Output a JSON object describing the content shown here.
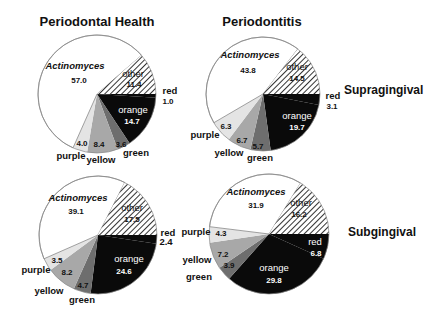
{
  "colors": {
    "actinomyces": "#ffffff",
    "other_hatch_bg": "#ffffff",
    "other_hatch_line": "#333333",
    "red": "#0a0a0a",
    "orange": "#0a0a0a",
    "green": "#6e6e6e",
    "yellow": "#a8a8a8",
    "purple": "#e4e4e4",
    "outline": "#888888",
    "text_dark": "#111111",
    "text_light": "#ffffff"
  },
  "column_titles": [
    "Periodontal Health",
    "Periodontitis"
  ],
  "row_labels": [
    "Supragingival",
    "Subgingival"
  ],
  "chart_data": [
    {
      "type": "pie",
      "title": "Periodontal Health",
      "row": "Supragingival",
      "categories": [
        "red",
        "orange",
        "green",
        "yellow",
        "purple",
        "Actinomyces",
        "other"
      ],
      "values": [
        1.0,
        14.7,
        3.6,
        8.4,
        4.0,
        57.0,
        11.4
      ],
      "start_angle_deg": 0,
      "direction": "clockwise"
    },
    {
      "type": "pie",
      "title": "Periodontitis",
      "row": "Supragingival",
      "categories": [
        "red",
        "orange",
        "green",
        "yellow",
        "purple",
        "Actinomyces",
        "other"
      ],
      "values": [
        3.1,
        19.7,
        5.7,
        6.7,
        6.3,
        43.8,
        14.5
      ],
      "start_angle_deg": 0,
      "direction": "clockwise"
    },
    {
      "type": "pie",
      "title": "Periodontal Health",
      "row": "Subgingival",
      "categories": [
        "red",
        "orange",
        "green",
        "yellow",
        "purple",
        "Actinomyces",
        "other"
      ],
      "values": [
        2.4,
        24.6,
        4.7,
        8.2,
        3.5,
        39.1,
        17.5
      ],
      "start_angle_deg": 0,
      "direction": "clockwise"
    },
    {
      "type": "pie",
      "title": "Periodontitis",
      "row": "Subgingival",
      "categories": [
        "red",
        "orange",
        "green",
        "yellow",
        "purple",
        "Actinomyces",
        "other"
      ],
      "values": [
        6.8,
        29.8,
        3.9,
        7.2,
        4.3,
        31.9,
        16.2
      ],
      "start_angle_deg": 0,
      "direction": "clockwise"
    }
  ],
  "pies": [
    {
      "cx": 97,
      "cy": 94,
      "r": 59,
      "labels": [
        {
          "text": "red",
          "x": 170,
          "y": 94,
          "anchor": "middle",
          "bold": true,
          "color": "dark"
        },
        {
          "text": "1.0",
          "x": 168,
          "y": 104,
          "anchor": "middle",
          "bold": true,
          "color": "dark",
          "small": true
        },
        {
          "text": "orange",
          "x": 133,
          "y": 113,
          "anchor": "middle",
          "bold": false,
          "color": "light"
        },
        {
          "text": "14.7",
          "x": 132,
          "y": 124,
          "anchor": "middle",
          "bold": true,
          "color": "light",
          "small": true
        },
        {
          "text": "3.6",
          "x": 121,
          "y": 147,
          "anchor": "middle",
          "bold": true,
          "color": "dark",
          "small": true
        },
        {
          "text": "green",
          "x": 136,
          "y": 156,
          "anchor": "middle",
          "bold": true,
          "color": "dark"
        },
        {
          "text": "8.4",
          "x": 99,
          "y": 147,
          "anchor": "middle",
          "bold": true,
          "color": "dark",
          "small": true
        },
        {
          "text": "yellow",
          "x": 101,
          "y": 163,
          "anchor": "middle",
          "bold": true,
          "color": "dark"
        },
        {
          "text": "4.0",
          "x": 82,
          "y": 146,
          "anchor": "middle",
          "bold": true,
          "color": "dark",
          "small": true
        },
        {
          "text": "purple",
          "x": 71,
          "y": 159,
          "anchor": "middle",
          "bold": true,
          "color": "dark"
        },
        {
          "text": "Actinomyces",
          "x": 75,
          "y": 69,
          "anchor": "middle",
          "bold": true,
          "italic": true,
          "color": "dark"
        },
        {
          "text": "57.0",
          "x": 79,
          "y": 83,
          "anchor": "middle",
          "bold": true,
          "color": "dark",
          "small": true
        },
        {
          "text": "other",
          "x": 133,
          "y": 77,
          "anchor": "middle",
          "bold": false,
          "color": "dark"
        },
        {
          "text": "11.4",
          "x": 134,
          "y": 87,
          "anchor": "middle",
          "bold": true,
          "color": "dark",
          "small": true
        }
      ]
    },
    {
      "cx": 263,
      "cy": 94,
      "r": 57,
      "labels": [
        {
          "text": "red",
          "x": 333,
          "y": 99,
          "anchor": "middle",
          "bold": true,
          "color": "dark"
        },
        {
          "text": "3.1",
          "x": 332,
          "y": 109,
          "anchor": "middle",
          "bold": true,
          "color": "dark",
          "small": true
        },
        {
          "text": "orange",
          "x": 297,
          "y": 119,
          "anchor": "middle",
          "bold": false,
          "color": "light"
        },
        {
          "text": "19.7",
          "x": 297,
          "y": 130,
          "anchor": "middle",
          "bold": true,
          "color": "light",
          "small": true
        },
        {
          "text": "5.7",
          "x": 258,
          "y": 149,
          "anchor": "middle",
          "bold": true,
          "color": "dark",
          "small": true
        },
        {
          "text": "green",
          "x": 260,
          "y": 161,
          "anchor": "middle",
          "bold": true,
          "color": "dark"
        },
        {
          "text": "6.7",
          "x": 242,
          "y": 143,
          "anchor": "middle",
          "bold": true,
          "color": "dark",
          "small": true
        },
        {
          "text": "yellow",
          "x": 229,
          "y": 156,
          "anchor": "middle",
          "bold": true,
          "color": "dark"
        },
        {
          "text": "6.3",
          "x": 226,
          "y": 129,
          "anchor": "middle",
          "bold": true,
          "color": "dark",
          "small": true
        },
        {
          "text": "purple",
          "x": 205,
          "y": 138,
          "anchor": "middle",
          "bold": true,
          "color": "dark"
        },
        {
          "text": "Actinomyces",
          "x": 250,
          "y": 58,
          "anchor": "middle",
          "bold": true,
          "italic": true,
          "color": "dark"
        },
        {
          "text": "43.8",
          "x": 248,
          "y": 73,
          "anchor": "middle",
          "bold": true,
          "color": "dark",
          "small": true
        },
        {
          "text": "other",
          "x": 297,
          "y": 70,
          "anchor": "middle",
          "bold": false,
          "color": "dark"
        },
        {
          "text": "14.5",
          "x": 297,
          "y": 81,
          "anchor": "middle",
          "bold": true,
          "color": "dark",
          "small": true
        }
      ]
    },
    {
      "cx": 98,
      "cy": 235,
      "r": 59,
      "labels": [
        {
          "text": "red",
          "x": 168,
          "y": 236,
          "anchor": "middle",
          "bold": true,
          "color": "dark"
        },
        {
          "text": "2.4",
          "x": 166,
          "y": 245,
          "anchor": "middle",
          "bold": true,
          "color": "dark",
          "small": false
        },
        {
          "text": "orange",
          "x": 129,
          "y": 262,
          "anchor": "middle",
          "bold": false,
          "color": "light"
        },
        {
          "text": "24.6",
          "x": 124,
          "y": 274,
          "anchor": "middle",
          "bold": true,
          "color": "light",
          "small": true
        },
        {
          "text": "4.7",
          "x": 83,
          "y": 288,
          "anchor": "middle",
          "bold": true,
          "color": "dark",
          "small": true
        },
        {
          "text": "green",
          "x": 82,
          "y": 303,
          "anchor": "middle",
          "bold": true,
          "color": "dark"
        },
        {
          "text": "8.2",
          "x": 67,
          "y": 275,
          "anchor": "middle",
          "bold": true,
          "color": "dark",
          "small": true
        },
        {
          "text": "yellow",
          "x": 49,
          "y": 294,
          "anchor": "middle",
          "bold": true,
          "color": "dark"
        },
        {
          "text": "3.5",
          "x": 57,
          "y": 263,
          "anchor": "middle",
          "bold": true,
          "color": "dark",
          "small": true
        },
        {
          "text": "purple",
          "x": 36,
          "y": 273,
          "anchor": "middle",
          "bold": true,
          "color": "dark"
        },
        {
          "text": "Actinomyces",
          "x": 78,
          "y": 201,
          "anchor": "middle",
          "bold": true,
          "italic": true,
          "color": "dark"
        },
        {
          "text": "39.1",
          "x": 76,
          "y": 214,
          "anchor": "middle",
          "bold": true,
          "color": "dark",
          "small": true
        },
        {
          "text": "other",
          "x": 132,
          "y": 211,
          "anchor": "middle",
          "bold": false,
          "color": "dark"
        },
        {
          "text": "17.5",
          "x": 132,
          "y": 222,
          "anchor": "middle",
          "bold": true,
          "color": "dark",
          "small": true
        }
      ]
    },
    {
      "cx": 269,
      "cy": 234,
      "r": 60,
      "labels": [
        {
          "text": "red",
          "x": 315,
          "y": 245,
          "anchor": "middle",
          "bold": false,
          "color": "light"
        },
        {
          "text": "6.8",
          "x": 316,
          "y": 256,
          "anchor": "middle",
          "bold": true,
          "color": "light",
          "small": true
        },
        {
          "text": "orange",
          "x": 274,
          "y": 271,
          "anchor": "middle",
          "bold": false,
          "color": "light"
        },
        {
          "text": "29.8",
          "x": 274,
          "y": 283,
          "anchor": "middle",
          "bold": true,
          "color": "light",
          "small": true
        },
        {
          "text": "3.9",
          "x": 229,
          "y": 268,
          "anchor": "middle",
          "bold": true,
          "color": "dark",
          "small": true
        },
        {
          "text": "green",
          "x": 199,
          "y": 280,
          "anchor": "middle",
          "bold": true,
          "color": "dark"
        },
        {
          "text": "7.2",
          "x": 223,
          "y": 257,
          "anchor": "middle",
          "bold": true,
          "color": "dark",
          "small": true
        },
        {
          "text": "yellow",
          "x": 197,
          "y": 263,
          "anchor": "middle",
          "bold": true,
          "color": "dark"
        },
        {
          "text": "4.3",
          "x": 221,
          "y": 236,
          "anchor": "middle",
          "bold": true,
          "color": "dark",
          "small": true
        },
        {
          "text": "purple",
          "x": 196,
          "y": 235,
          "anchor": "middle",
          "bold": true,
          "color": "dark"
        },
        {
          "text": "Actinomyces",
          "x": 256,
          "y": 195,
          "anchor": "middle",
          "bold": true,
          "italic": true,
          "color": "dark"
        },
        {
          "text": "31.9",
          "x": 256,
          "y": 208,
          "anchor": "middle",
          "bold": true,
          "color": "dark",
          "small": true
        },
        {
          "text": "other",
          "x": 301,
          "y": 206,
          "anchor": "middle",
          "bold": false,
          "color": "dark"
        },
        {
          "text": "16.2",
          "x": 299,
          "y": 217,
          "anchor": "middle",
          "bold": true,
          "color": "dark",
          "small": true
        }
      ]
    }
  ]
}
